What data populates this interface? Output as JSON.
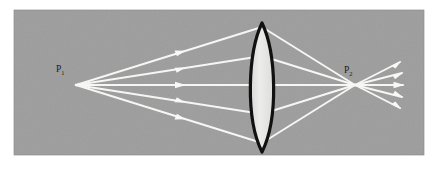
{
  "figure": {
    "kind": "optics-ray-diagram",
    "caption": "",
    "panel": {
      "background_color": "#9d9d9d",
      "page_color": "#ffffff",
      "x": 14,
      "y": 10,
      "width": 410,
      "height": 145
    },
    "labels": {
      "object_point": {
        "base": "P",
        "subscript": "1",
        "full": "P1",
        "x": 62,
        "y": 70
      },
      "image_point": {
        "base": "P",
        "subscript": "2",
        "full": "P2",
        "x": 347,
        "y": 71
      }
    },
    "object_point": {
      "x": 76,
      "y": 85
    },
    "image_point": {
      "x": 355,
      "y": 85
    },
    "lens": {
      "type": "biconvex-converging",
      "center_x": 262,
      "top_y": 23,
      "bottom_y": 152,
      "half_width": 17,
      "outline_color": "#111111",
      "outline_width": 3.2,
      "fill_color": "#e3e3e1"
    },
    "rays": {
      "color": "#f6f6f4",
      "line_width": 1.9,
      "count": 5,
      "incoming_arrow_x": 181,
      "outgoing_arrow_x": 396,
      "lens_hit_offsets": [
        -58,
        -29,
        0,
        29,
        58
      ],
      "incoming": [
        {
          "id": "ray-1",
          "from_x": 76,
          "from_y": 85,
          "to_x": 262,
          "to_y": 27
        },
        {
          "id": "ray-2",
          "from_x": 76,
          "from_y": 85,
          "to_x": 262,
          "to_y": 56
        },
        {
          "id": "ray-3",
          "from_x": 76,
          "from_y": 85,
          "to_x": 262,
          "to_y": 85
        },
        {
          "id": "ray-4",
          "from_x": 76,
          "from_y": 85,
          "to_x": 262,
          "to_y": 114
        },
        {
          "id": "ray-5",
          "from_x": 76,
          "from_y": 85,
          "to_x": 262,
          "to_y": 143
        }
      ],
      "refracted": [
        {
          "id": "ray-1-refracted",
          "from_x": 262,
          "from_y": 27,
          "to_x": 355,
          "to_y": 85
        },
        {
          "id": "ray-2-refracted",
          "from_x": 262,
          "from_y": 56,
          "to_x": 355,
          "to_y": 85
        },
        {
          "id": "ray-3-refracted",
          "from_x": 262,
          "from_y": 85,
          "to_x": 355,
          "to_y": 85
        },
        {
          "id": "ray-4-refracted",
          "from_x": 262,
          "from_y": 114,
          "to_x": 355,
          "to_y": 85
        },
        {
          "id": "ray-5-refracted",
          "from_x": 262,
          "from_y": 143,
          "to_x": 355,
          "to_y": 85
        }
      ],
      "diverging": [
        {
          "id": "ray-1-diverging",
          "from_x": 355,
          "from_y": 85,
          "to_x": 400,
          "to_y": 62
        },
        {
          "id": "ray-2-diverging",
          "from_x": 355,
          "from_y": 85,
          "to_x": 402,
          "to_y": 73
        },
        {
          "id": "ray-3-diverging",
          "from_x": 355,
          "from_y": 85,
          "to_x": 403,
          "to_y": 85
        },
        {
          "id": "ray-4-diverging",
          "from_x": 355,
          "from_y": 85,
          "to_x": 402,
          "to_y": 97
        },
        {
          "id": "ray-5-diverging",
          "from_x": 355,
          "from_y": 85,
          "to_x": 400,
          "to_y": 108
        }
      ]
    }
  }
}
